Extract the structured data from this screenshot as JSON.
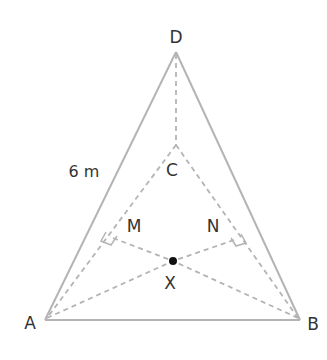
{
  "diagram": {
    "labels": {
      "D": "D",
      "C": "C",
      "A": "A",
      "B": "B",
      "M": "M",
      "N": "N",
      "X": "X"
    },
    "measurement": "6 m",
    "colors": {
      "edge": "#b4b4b4",
      "text": "#333333",
      "point": "#111111",
      "background": "#ffffff"
    },
    "points": {
      "D": [
        176,
        52
      ],
      "A": [
        45,
        320
      ],
      "B": [
        300,
        320
      ],
      "C": [
        176,
        145
      ],
      "M": [
        113,
        238
      ],
      "N": [
        234,
        240
      ],
      "X": [
        173,
        261
      ]
    },
    "edges_solid": [
      [
        "D",
        "A"
      ],
      [
        "D",
        "B"
      ],
      [
        "A",
        "B"
      ]
    ],
    "edges_dashed": [
      [
        "D",
        "C"
      ],
      [
        "C",
        "A"
      ],
      [
        "C",
        "B"
      ],
      [
        "A",
        "X"
      ],
      [
        "B",
        "X"
      ],
      [
        "M",
        "X"
      ],
      [
        "N",
        "X"
      ]
    ]
  }
}
